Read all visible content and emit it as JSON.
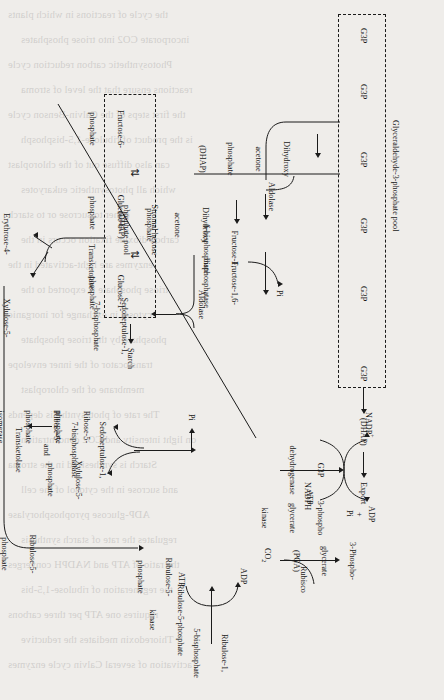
{
  "domain_note": "Calvin cycle / Reductive pentose phosphate pathway schematic, page rotated 90 degrees",
  "pools": {
    "g3p_pool_label": "Glyceraldehyde-3-phosphate pool",
    "g3p_node": "G3P",
    "g3p_count": 6,
    "hexose_pool_label_line1": "Stromal hexose",
    "hexose_pool_label_line2": "phosphate pool"
  },
  "metabolites": {
    "dhap_short": "(DHAP)",
    "export": "Export",
    "dhap_full_l1": "Dihydroxy",
    "dhap_full_l2": "acetone",
    "dhap_full_l3": "phosphate",
    "dhap_full_l4": "(DHAP)",
    "fbp_l1": "Fructose-1,",
    "fbp_l2": "6-bisphosphate",
    "f6p_l1": "Fructose-6-",
    "f6p_l2": "phosphate",
    "g6p_l1": "Glucose-6-",
    "g6p_l2": "phosphate",
    "g1p_l1": "Glucose-1-",
    "g1p_l2": "phosphate",
    "starch": "Starch",
    "e4p_l1": "Erythrose-4-",
    "e4p_l2": "phosphate",
    "xu5p_l1": "Xylulose-5-",
    "xu5p_l2": "phosphate",
    "sbp_l1": "Sedoheptulose-1,",
    "sbp_l2": "7-bisphosphate",
    "r5p_l1": "Ribose-5-",
    "r5p_l2": "phosphate",
    "ru5p_l1": "Ribulose-5-",
    "ru5p_l2": "phosphate",
    "rubp_l1": "Ribulose-1,",
    "rubp_l2": "5-bisphosphate",
    "pga_l1": "3-Phospho-",
    "pga_l2": "glycerate",
    "pga_l3": "(PGA)",
    "co2": "CO2",
    "pi": "Pi"
  },
  "enzymes": {
    "aldolase": "Aldolase",
    "aldolase2": "Aldolase",
    "fbpase_l1": "Fructose-1,6-",
    "fbpase_l2": "bisphosphatase",
    "transketolase": "Transketolase",
    "sbpase_l1": "Sedoheptulose-1,",
    "sbpase_l2": "7-bisphosphatase",
    "sbpase_l3": "and",
    "sbpase_l4": "Transketolase",
    "r5p_isomerase_l1": "Ribose-5-",
    "r5p_isomerase_l2": "phosphate",
    "r5p_isomerase_l3": "isomerase",
    "ru5p_epimerase_l1": "Ribulose-5-",
    "ru5p_epimerase_l2": "phosphate",
    "ru5p_epimerase_l3": "epimerase",
    "ru5p_kinase_l1": "Ribulose-5-phosphate",
    "ru5p_kinase_l2": "kinase",
    "rubisco": "Rubisco",
    "g3p_dehydrogenase_l1": "G3P",
    "g3p_dehydrogenase_l2": "dehydrogenase",
    "pgk_l1": "3-phospho",
    "pgk_l2": "glycerate",
    "pgk_l3": "kinase"
  },
  "cofactors": {
    "nadph": "NADPH",
    "nadp_plus": "NADP",
    "nadp_charge": "+",
    "atp": "ATP",
    "adp": "ADP",
    "plus": "+",
    "pi": "Pi",
    "atp2": "ATP",
    "adp2": "ADP"
  },
  "symbols": {
    "equilibrium": "⇅",
    "arrow_right": "→"
  },
  "colors": {
    "page_background": "#efedea",
    "ink": "#1b1b1b",
    "ghost_text": "#3a3a3a"
  },
  "ghost_text_lines": [
    "the cycle of reactions in which plants",
    "incorporate CO2 into triose phosphates",
    "Photosynthetic carbon reduction cycle",
    "reactions ensure that the level of stroma",
    "the first steps of the Calvin-Benson cycle",
    "is the product of ribulose-1,5-bisphosph",
    "can also diffuse out of the chloroplast",
    "which all photosynthetic eukaryotes",
    "either to sucrose or to starch",
    "carbon dioxide fixation occurs in the",
    "enzymes are light-activated in the",
    "triose phosphate is exported to the",
    "cytosol in exchange for inorganic",
    "phosphate by the triose phosphate",
    "translocator of the inner envelope",
    "membrane of the chloroplast",
    "The rate of photosynthesis depends",
    "on light intensity and CO2 concentration",
    "Starch is synthesized in the stroma",
    "and sucrose in the cytosol of the cell",
    "ADP-glucose pyrophosphorylase",
    "regulates the rate of starch synthesis",
    "the ratio of ATP and NADPH converges",
    "the regeneration of ribulose-1,5-bis",
    "requires one ATP per three carbons",
    "Thioredoxin mediates the reductive",
    "activation of several Calvin cycle enzymes"
  ]
}
